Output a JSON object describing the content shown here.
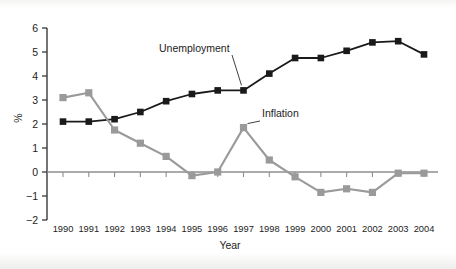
{
  "chart_data": {
    "type": "line",
    "title": "",
    "xlabel": "Year",
    "ylabel": "%",
    "categories": [
      "1990",
      "1991",
      "1992",
      "1993",
      "1994",
      "1995",
      "1996",
      "1997",
      "1998",
      "1999",
      "2000",
      "2001",
      "2002",
      "2003",
      "2004"
    ],
    "x": [
      1990,
      1991,
      1992,
      1993,
      1994,
      1995,
      1996,
      1997,
      1998,
      1999,
      2000,
      2001,
      2002,
      2003,
      2004
    ],
    "series": [
      {
        "name": "Unemployment",
        "color": "#1a1a1a",
        "marker": "square",
        "values": [
          2.1,
          2.1,
          2.2,
          2.5,
          2.95,
          3.25,
          3.4,
          3.4,
          4.1,
          4.75,
          4.75,
          5.05,
          5.4,
          5.45,
          4.9
        ]
      },
      {
        "name": "Inflation",
        "color": "#9a9a9a",
        "marker": "square",
        "values": [
          3.1,
          3.3,
          1.75,
          1.2,
          0.65,
          -0.15,
          0.0,
          1.85,
          0.5,
          -0.2,
          -0.85,
          -0.7,
          -0.85,
          -0.05,
          -0.05
        ]
      }
    ],
    "ylim": [
      -2,
      6
    ],
    "yticks": [
      -2,
      -1,
      0,
      1,
      2,
      3,
      4,
      5,
      6
    ],
    "ytick_labels": [
      "−2",
      "−1",
      "0",
      "1",
      "2",
      "3",
      "4",
      "5",
      "6"
    ],
    "grid": false,
    "legend": "inline-annotations",
    "annotations": [
      {
        "text": "Unemployment",
        "points_to_year": 1997,
        "points_to_value": 3.4
      },
      {
        "text": "Inflation",
        "points_to_year": 1997,
        "points_to_value": 1.85
      }
    ]
  },
  "axes": {
    "y_label": "%",
    "x_label": "Year",
    "zero_line_value": "0"
  }
}
